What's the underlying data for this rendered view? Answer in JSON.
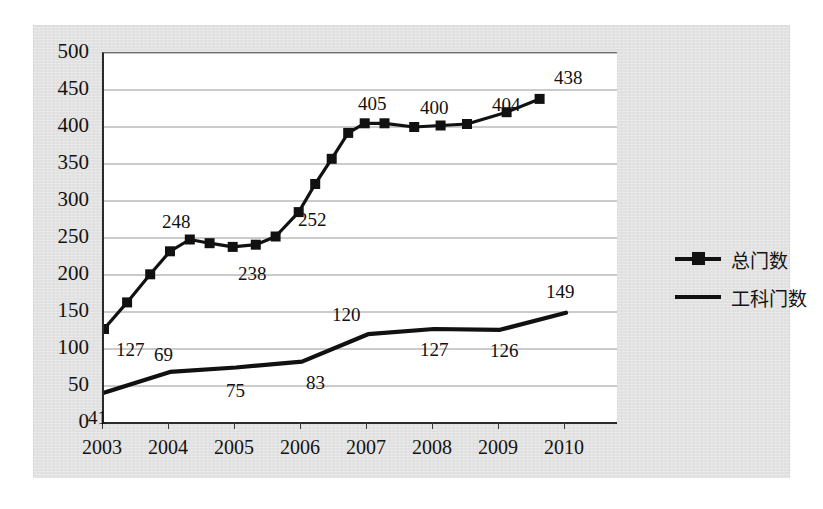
{
  "chart_data": {
    "type": "line",
    "title": "",
    "subtitle": "",
    "xlabel": "",
    "ylabel": "",
    "grid": true,
    "legend_position": "right",
    "xlim": [
      2003,
      2010
    ],
    "ylim": [
      0,
      500
    ],
    "y_ticks": [
      500,
      450,
      400,
      350,
      300,
      250,
      200,
      150,
      100,
      50,
      0
    ],
    "categories": [
      "2003",
      "2004",
      "2005",
      "2006",
      "2007",
      "2008",
      "2009",
      "2010"
    ],
    "x": [
      2003,
      2003.5,
      2004,
      2004.5,
      2005,
      2005.5,
      2006,
      2006.5,
      2007,
      2007.5,
      2008,
      2008.5,
      2009,
      2009.5,
      2010
    ],
    "series": [
      {
        "name": "总门数",
        "marker": "square",
        "color": "#111111",
        "values": [
          127,
          163,
          201,
          232,
          248,
          243,
          238,
          241,
          252,
          285,
          323,
          357,
          392,
          405,
          405,
          400,
          402,
          404,
          420,
          438
        ],
        "x_values": [
          2003,
          2003.35,
          2003.7,
          2004.0,
          2004.3,
          2004.6,
          2004.95,
          2005.3,
          2005.6,
          2005.95,
          2006.2,
          2006.45,
          2006.7,
          2006.95,
          2007.25,
          2007.7,
          2008.1,
          2008.5,
          2009.1,
          2009.6
        ],
        "labeled_points": [
          {
            "label": "127",
            "value": 127,
            "year": "2003"
          },
          {
            "label": "248",
            "value": 248,
            "year": "2004"
          },
          {
            "label": "238",
            "value": 238,
            "year": "2005"
          },
          {
            "label": "252",
            "value": 252,
            "year": "2006"
          },
          {
            "label": "405",
            "value": 405,
            "year": "2007"
          },
          {
            "label": "400",
            "value": 400,
            "year": "2008"
          },
          {
            "label": "404",
            "value": 404,
            "year": "2009"
          },
          {
            "label": "438",
            "value": 438,
            "year": "2010"
          }
        ]
      },
      {
        "name": "工科门数",
        "marker": "none",
        "color": "#111111",
        "values": [
          41,
          69,
          75,
          83,
          120,
          127,
          126,
          149
        ],
        "labeled_points": [
          {
            "label": "41",
            "value": 41,
            "year": "2003"
          },
          {
            "label": "69",
            "value": 69,
            "year": "2004"
          },
          {
            "label": "75",
            "value": 75,
            "year": "2005"
          },
          {
            "label": "83",
            "value": 83,
            "year": "2006"
          },
          {
            "label": "120",
            "value": 120,
            "year": "2007"
          },
          {
            "label": "127",
            "value": 127,
            "year": "2008"
          },
          {
            "label": "126",
            "value": 126,
            "year": "2009"
          },
          {
            "label": "149",
            "value": 149,
            "year": "2010"
          }
        ]
      }
    ]
  },
  "axes": {
    "y_labels": [
      "500",
      "450",
      "400",
      "350",
      "300",
      "250",
      "200",
      "150",
      "100",
      "50",
      "0"
    ],
    "x_labels": [
      "2003",
      "2004",
      "2005",
      "2006",
      "2007",
      "2008",
      "2009",
      "2010"
    ]
  },
  "legend": {
    "items": [
      {
        "label": "总门数",
        "marker": "square"
      },
      {
        "label": "工科门数",
        "marker": "line"
      }
    ]
  },
  "data_labels": {
    "total": [
      "127",
      "248",
      "238",
      "252",
      "405",
      "400",
      "404",
      "438"
    ],
    "engineering": [
      "41",
      "69",
      "75",
      "83",
      "120",
      "127",
      "126",
      "149"
    ]
  }
}
